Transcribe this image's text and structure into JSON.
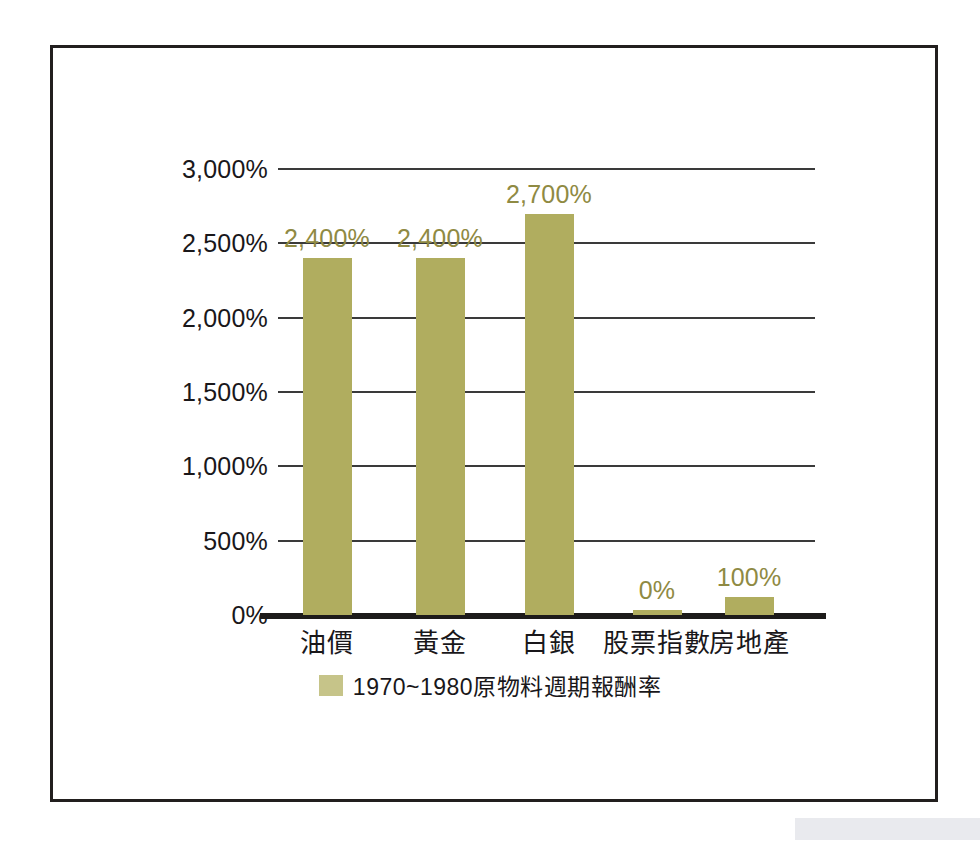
{
  "chart_data": {
    "type": "bar",
    "title": "",
    "subtitle": "",
    "xlabel": "",
    "ylabel": "",
    "categories": [
      "油價",
      "黃金",
      "白銀",
      "股票指數",
      "房地產"
    ],
    "values": [
      2400,
      2400,
      2700,
      0,
      100
    ],
    "data_labels": [
      "2,400%",
      "2,400%",
      "2,700%",
      "0%",
      "100%"
    ],
    "series": [
      {
        "name": "1970~1980原物料週期報酬率",
        "values": [
          2400,
          2400,
          2700,
          0,
          100
        ]
      }
    ],
    "ylim": [
      0,
      3000
    ],
    "ytick_values": [
      0,
      500,
      1000,
      1500,
      2000,
      2500,
      3000
    ],
    "ytick_labels": [
      "0%",
      "500%",
      "1,000%",
      "1,500%",
      "2,000%",
      "2,500%",
      "3,000%"
    ],
    "grid": true,
    "legend": {
      "position": "bottom-center",
      "entries": [
        {
          "label": "1970~1980原物料週期報酬率",
          "color": "#c6c489"
        }
      ]
    },
    "colors": {
      "bar": "#b0ad5f",
      "data_label": "#8f8a43",
      "axis_text": "#19171a",
      "gridline": "#3a3a3a",
      "baseline": "#1d1b1a",
      "frame": "#221f1e",
      "background": "#ffffff"
    }
  }
}
